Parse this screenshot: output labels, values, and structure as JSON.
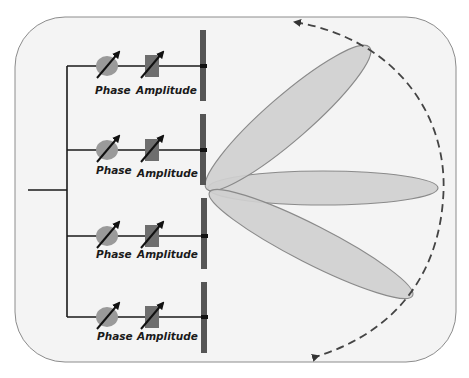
{
  "diagram": {
    "channels": [
      {
        "phase_label": "Phase",
        "amplitude_label": "Amplitude",
        "y": 66
      },
      {
        "phase_label": "Phase",
        "amplitude_label": "Amplitude",
        "y": 150
      },
      {
        "phase_label": "Phase",
        "amplitude_label": "Amplitude",
        "y": 236
      },
      {
        "phase_label": "Phase",
        "amplitude_label": "Amplitude",
        "y": 317
      }
    ],
    "beams": [
      "upper-beam",
      "center-beam",
      "lower-beam"
    ],
    "scan_arc": "dashed scan arc with arrowheads at both ends",
    "colors": {
      "background_panel": "#f4f4f4",
      "panel_border": "#888888",
      "feed_line": "#1a1a1a",
      "phase_shifter": "#9a9a9a",
      "amplitude_block": "#6e6e6e",
      "antenna_element": "#555555",
      "beam_fill": "#cfcfcf",
      "beam_stroke": "#8a8a8a",
      "arc": "#444444"
    }
  }
}
